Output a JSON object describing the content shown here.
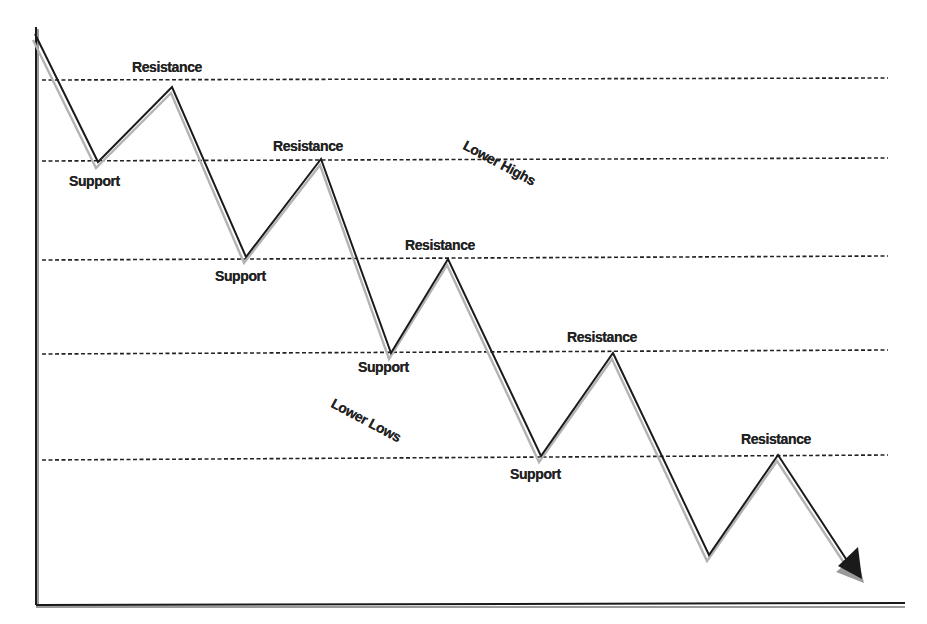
{
  "diagram": {
    "type": "support-resistance-downtrend",
    "colors": {
      "line": "#1a1a1a",
      "shadow": "#b3b3b3",
      "dashed": "#222222",
      "axis": "#1a1a1a",
      "text": "#222222"
    },
    "axes": {
      "origin": [
        36,
        604
      ],
      "y_top": 27,
      "x_right": 905
    },
    "levels_y": [
      80,
      159,
      258,
      352,
      460
    ],
    "levels_x_range": [
      42,
      888
    ],
    "path_points": [
      [
        34,
        34
      ],
      [
        97,
        163
      ],
      [
        171,
        88
      ],
      [
        245,
        258
      ],
      [
        320,
        160
      ],
      [
        390,
        354
      ],
      [
        447,
        260
      ],
      [
        540,
        457
      ],
      [
        612,
        354
      ],
      [
        708,
        556
      ],
      [
        777,
        456
      ],
      [
        857,
        577
      ]
    ],
    "labels": {
      "resistance_1": "Resistance",
      "resistance_2": "Resistance",
      "resistance_3": "Resistance",
      "resistance_4": "Resistance",
      "resistance_5": "Resistance",
      "support_1": "Support",
      "support_2": "Support",
      "support_3": "Support",
      "support_4": "Support",
      "lower_highs": "Lower Highs",
      "lower_lows": "Lower Lows"
    }
  }
}
